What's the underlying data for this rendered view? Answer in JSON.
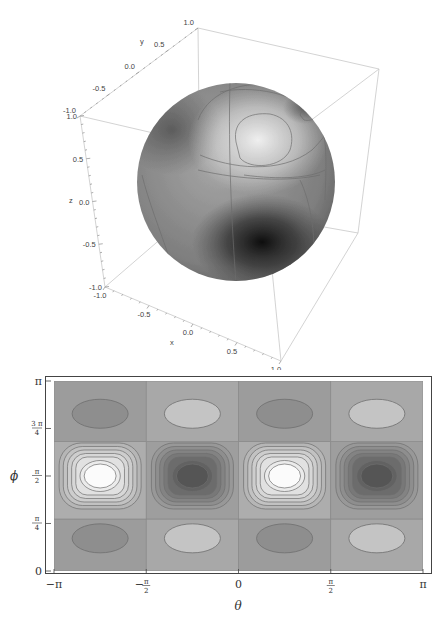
{
  "chart_data": [
    {
      "type": "surface3d",
      "title": "",
      "description": "Unit sphere colored by a spherical-harmonic-like function with contour lines; light lobe upper right, dark lobe lower front",
      "axes": {
        "x": {
          "label": "x",
          "range": [
            -1.0,
            1.0
          ],
          "ticks": [
            "-1.0",
            "-0.5",
            "0.0",
            "0.5",
            "1.0"
          ]
        },
        "y": {
          "label": "y",
          "range": [
            -1.0,
            1.0
          ],
          "ticks": [
            "-1.0",
            "-0.5",
            "0.0",
            "0.5",
            "1.0"
          ]
        },
        "z": {
          "label": "z",
          "range": [
            -1.0,
            1.0
          ],
          "ticks": [
            "-1.0",
            "-0.5",
            "0.0",
            "0.5",
            "1.0"
          ]
        }
      },
      "sphere_radius": 1.0,
      "colormap": "grayscale",
      "colors": {
        "light": "#f2f2f2",
        "mid": "#9a9a9a",
        "dark": "#1e1e1e",
        "contour": "#777777",
        "box": "#c8c8c8"
      }
    },
    {
      "type": "heatmap",
      "subtype": "contour",
      "title": "",
      "xlabel": "θ",
      "ylabel": "ϕ",
      "xlim": [
        -3.14159,
        3.14159
      ],
      "ylim": [
        0,
        3.14159
      ],
      "xticks": [
        {
          "value": -3.14159,
          "label": "−π"
        },
        {
          "value": -1.5708,
          "label_num": "π",
          "label_den": "2",
          "neg": true
        },
        {
          "value": 0,
          "label": "0"
        },
        {
          "value": 1.5708,
          "label_num": "π",
          "label_den": "2",
          "neg": false
        },
        {
          "value": 3.14159,
          "label": "π"
        }
      ],
      "yticks": [
        {
          "value": 0,
          "label": "0"
        },
        {
          "value": 0.7854,
          "label_num": "π",
          "label_den": "4"
        },
        {
          "value": 1.5708,
          "label_num": "π",
          "label_den": "2"
        },
        {
          "value": 2.3562,
          "label_num": "3 π",
          "label_den": "4"
        },
        {
          "value": 3.14159,
          "label": "π"
        }
      ],
      "band_boundaries_phi": [
        0.86,
        2.14
      ],
      "cell_grid_theta": [
        -3.14159,
        -1.5708,
        0,
        1.5708,
        3.14159
      ],
      "extrema": [
        {
          "theta": -2.356,
          "phi": 1.5708,
          "kind": "max",
          "band": "middle"
        },
        {
          "theta": -0.785,
          "phi": 1.5708,
          "kind": "min",
          "band": "middle"
        },
        {
          "theta": 0.785,
          "phi": 1.5708,
          "kind": "max",
          "band": "middle"
        },
        {
          "theta": 2.356,
          "phi": 1.5708,
          "kind": "min",
          "band": "middle"
        },
        {
          "theta": -2.356,
          "phi": 2.6,
          "kind": "min",
          "band": "top"
        },
        {
          "theta": -0.785,
          "phi": 2.6,
          "kind": "max",
          "band": "top"
        },
        {
          "theta": 0.785,
          "phi": 2.6,
          "kind": "min",
          "band": "top"
        },
        {
          "theta": 2.356,
          "phi": 2.6,
          "kind": "max",
          "band": "top"
        },
        {
          "theta": -2.356,
          "phi": 0.54,
          "kind": "min",
          "band": "bottom"
        },
        {
          "theta": -0.785,
          "phi": 0.54,
          "kind": "max",
          "band": "bottom"
        },
        {
          "theta": 0.785,
          "phi": 0.54,
          "kind": "min",
          "band": "bottom"
        },
        {
          "theta": 2.356,
          "phi": 0.54,
          "kind": "max",
          "band": "bottom"
        }
      ],
      "middle_contour_levels": 7,
      "colormap": "grayscale",
      "colors": {
        "background": "#a4a4a4",
        "light_peak": "#fbfbfb",
        "dark_peak": "#555555",
        "outer_light": "#c4c4c4",
        "outer_dark": "#8e8e8e",
        "contour": "#6f6f6f",
        "frame": "#444444"
      }
    }
  ]
}
